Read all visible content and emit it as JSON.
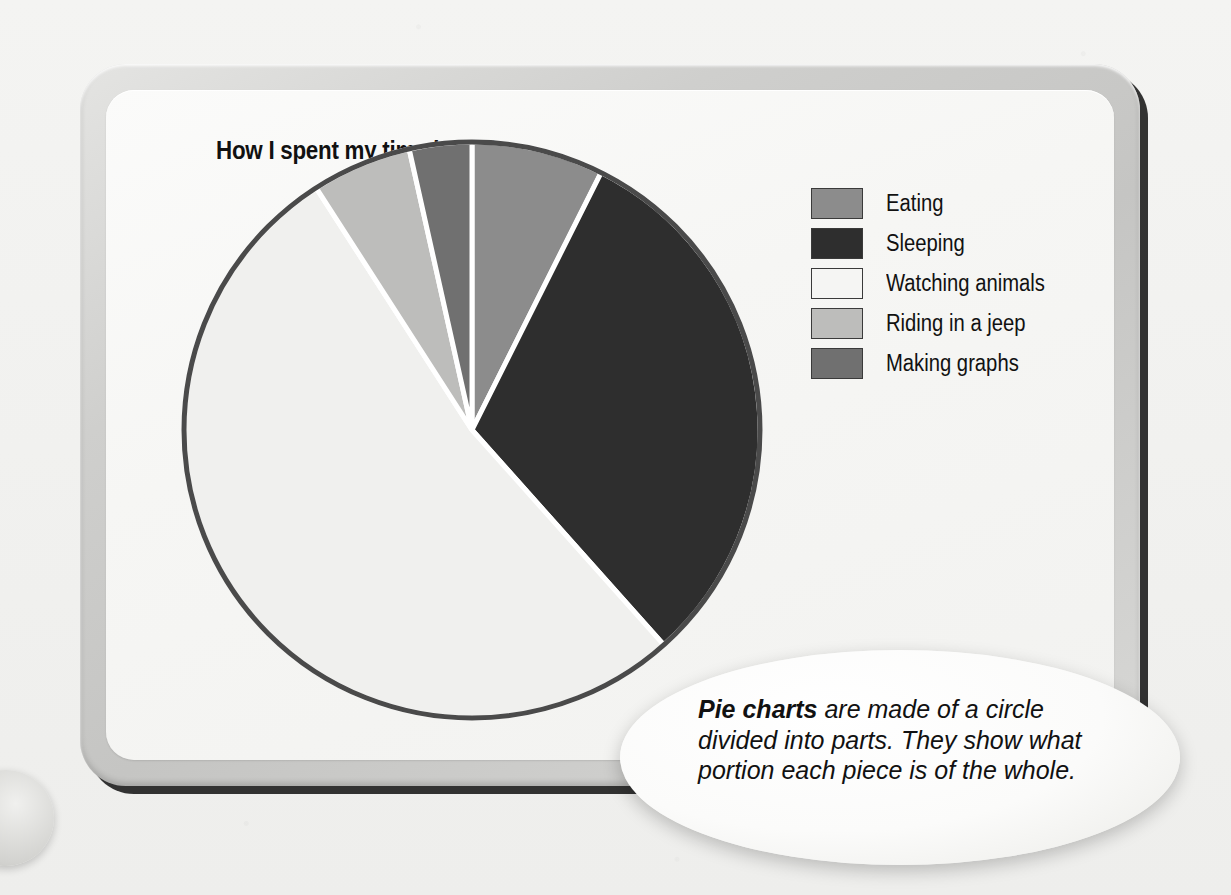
{
  "page": {
    "title": "How I spent my time in Africa"
  },
  "chart_data": {
    "type": "pie",
    "title": "How I spent my time in Africa",
    "categories": [
      "Eating",
      "Sleeping",
      "Watching animals",
      "Riding in a jeep",
      "Making graphs"
    ],
    "values": [
      7.4,
      31.0,
      52.5,
      5.6,
      3.5
    ],
    "units": "percent",
    "start_angle_deg": 0,
    "direction": "clockwise",
    "slice_colors": [
      "#8c8c8c",
      "#2e2e2e",
      "#f0f0ee",
      "#bdbdbb",
      "#707070"
    ],
    "slice_boundaries_deg": [
      0,
      26.7,
      138.0,
      327.0,
      347.0,
      360
    ],
    "outline_color": "#4a4a4a",
    "separator_color": "#ffffff",
    "legend_position": "right",
    "grid": false,
    "xlabel": "",
    "ylabel": ""
  },
  "legend": {
    "items": [
      {
        "label": "Eating",
        "color": "#8c8c8c"
      },
      {
        "label": "Sleeping",
        "color": "#2e2e2e"
      },
      {
        "label": "Watching animals",
        "color": "#f3f3f1"
      },
      {
        "label": "Riding in a jeep",
        "color": "#bdbdbb"
      },
      {
        "label": "Making graphs",
        "color": "#707070"
      }
    ]
  },
  "callout": {
    "bold_lead": "Pie charts",
    "body": " are made of a circle divided into parts. They show what portion each piece is of the whole.",
    "full_text": "Pie charts are made of a circle divided into parts. They show what portion each piece is of the whole."
  },
  "colors": {
    "panel_frame": "#cfcfcd",
    "panel_face": "#f6f6f4",
    "page_background": "#f2f2f0",
    "text": "#111111"
  }
}
